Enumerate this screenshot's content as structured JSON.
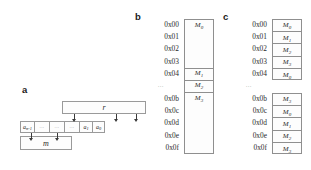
{
  "figure": {
    "panels": [
      "a",
      "b",
      "c"
    ]
  },
  "panel_a": {
    "label": "a",
    "register_box": {
      "name": "r"
    },
    "memory_box": {
      "name": "m"
    },
    "array_cells": [
      {
        "base": "a",
        "sub": "n-1"
      },
      {
        "base": "∙∙∙",
        "sub": ""
      },
      {
        "base": "∙∙∙",
        "sub": ""
      },
      {
        "base": "∙∙∙",
        "sub": ""
      },
      {
        "base": "a",
        "sub": "1"
      },
      {
        "base": "a",
        "sub": "0"
      }
    ],
    "down_arrows_from_r": 3,
    "down_arrows_to_m": 2
  },
  "panel_b": {
    "label": "b",
    "ellipsis": "∙∙∙",
    "addresses_top": [
      "0x00",
      "0x01",
      "0x02",
      "0x03",
      "0x04"
    ],
    "addresses_bottom": [
      "0x0b",
      "0x0c",
      "0x0d",
      "0x0e",
      "0x0f"
    ],
    "blocks": [
      {
        "base": "M",
        "sub": "0",
        "span": 4,
        "start": 0
      },
      {
        "base": "M",
        "sub": "1",
        "span": 1,
        "start": 4
      },
      {
        "base": "M",
        "sub": "2",
        "span": 1,
        "start": 5
      },
      {
        "base": "M",
        "sub": "3",
        "span": 4,
        "start": 6
      }
    ]
  },
  "panel_c": {
    "label": "c",
    "ellipsis": "∙∙∙",
    "addresses_top": [
      "0x00",
      "0x01",
      "0x02",
      "0x03",
      "0x04"
    ],
    "addresses_bottom": [
      "0x0b",
      "0x0c",
      "0x0d",
      "0x0e",
      "0x0f"
    ],
    "cells_top": [
      {
        "base": "M",
        "sub": "0"
      },
      {
        "base": "M",
        "sub": "1"
      },
      {
        "base": "M",
        "sub": "2"
      },
      {
        "base": "M",
        "sub": "3"
      },
      {
        "base": "M",
        "sub": "0"
      }
    ],
    "cells_bottom": [
      {
        "base": "M",
        "sub": "3"
      },
      {
        "base": "M",
        "sub": "0"
      },
      {
        "base": "M",
        "sub": "1"
      },
      {
        "base": "M",
        "sub": "2"
      },
      {
        "base": "M",
        "sub": "3"
      }
    ]
  },
  "colors": {
    "stroke": "#8f8f8f",
    "text": "#2b2b2b",
    "arrow": "#3a3a3a",
    "background": "#ffffff"
  }
}
